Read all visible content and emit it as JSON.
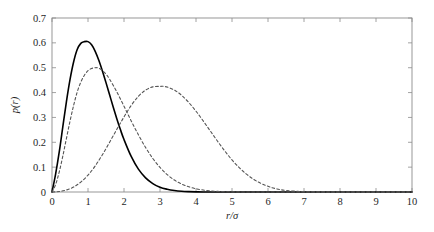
{
  "figure": {
    "background_color": "#ffffff",
    "frame_color": "#8c8c8c"
  },
  "axes": {
    "x_title": "r/σ",
    "y_title": "p(r)",
    "x_ticks": [
      "0",
      "1",
      "2",
      "3",
      "4",
      "5",
      "6",
      "7",
      "8",
      "9",
      "10"
    ],
    "y_ticks": [
      "0",
      "0.1",
      "0.2",
      "0.3",
      "0.4",
      "0.5",
      "0.6",
      "0.7"
    ]
  },
  "chart_data": {
    "type": "line",
    "title": "",
    "xlabel": "r/σ",
    "ylabel": "p(r)",
    "xlim": [
      0,
      10
    ],
    "ylim": [
      0,
      0.7
    ],
    "xticks": [
      0,
      1,
      2,
      3,
      4,
      5,
      6,
      7,
      8,
      9,
      10
    ],
    "yticks": [
      0,
      0.1,
      0.2,
      0.3,
      0.4,
      0.5,
      0.6,
      0.7
    ],
    "grid": false,
    "legend": "none",
    "tick_direction": "in",
    "tick_sides": [
      "bottom",
      "left",
      "top",
      "right"
    ],
    "series": [
      {
        "name": "curve-solid",
        "style": "solid",
        "color": "#000000",
        "linewidth": 1.6,
        "peak_x": 1.0,
        "peak_y": 0.605,
        "x": [
          0.0,
          0.1,
          0.2,
          0.3,
          0.4,
          0.5,
          0.6,
          0.7,
          0.8,
          0.9,
          1.0,
          1.1,
          1.2,
          1.3,
          1.4,
          1.5,
          1.6,
          1.7,
          1.8,
          1.9,
          2.0,
          2.2,
          2.4,
          2.6,
          2.8,
          3.0,
          3.2,
          3.4,
          3.6,
          3.8,
          4.0,
          4.2,
          4.5,
          5.0,
          5.5,
          6.0,
          7.0,
          8.0,
          9.0,
          10.0
        ],
        "y": [
          0.0,
          0.072,
          0.16,
          0.262,
          0.363,
          0.452,
          0.523,
          0.573,
          0.598,
          0.605,
          0.605,
          0.592,
          0.566,
          0.53,
          0.487,
          0.44,
          0.391,
          0.342,
          0.295,
          0.251,
          0.211,
          0.143,
          0.092,
          0.057,
          0.034,
          0.019,
          0.011,
          0.006,
          0.003,
          0.0015,
          0.0007,
          0.0003,
          0.0001,
          0.0,
          0.0,
          0.0,
          0.0,
          0.0,
          0.0,
          0.0
        ]
      },
      {
        "name": "curve-dashed-1",
        "style": "dashed",
        "color": "#555555",
        "linewidth": 1.1,
        "peak_x": 1.25,
        "peak_y": 0.5,
        "x": [
          0.0,
          0.1,
          0.2,
          0.3,
          0.4,
          0.5,
          0.6,
          0.7,
          0.8,
          0.9,
          1.0,
          1.1,
          1.2,
          1.25,
          1.3,
          1.4,
          1.5,
          1.6,
          1.8,
          2.0,
          2.2,
          2.4,
          2.6,
          2.8,
          3.0,
          3.2,
          3.4,
          3.6,
          3.8,
          4.0,
          4.2,
          4.4,
          4.6,
          4.8,
          5.0,
          5.5,
          6.0,
          7.0,
          8.0,
          9.0,
          10.0
        ],
        "y": [
          0.0,
          0.03,
          0.08,
          0.144,
          0.215,
          0.285,
          0.348,
          0.402,
          0.442,
          0.47,
          0.488,
          0.497,
          0.5,
          0.5,
          0.498,
          0.489,
          0.474,
          0.454,
          0.403,
          0.345,
          0.286,
          0.23,
          0.179,
          0.135,
          0.099,
          0.07,
          0.048,
          0.032,
          0.021,
          0.013,
          0.008,
          0.0045,
          0.0024,
          0.0012,
          0.0006,
          0.0001,
          0.0,
          0.0,
          0.0,
          0.0,
          0.0
        ]
      },
      {
        "name": "curve-dashed-2",
        "style": "dashed",
        "color": "#555555",
        "linewidth": 1.1,
        "peak_x": 3.1,
        "peak_y": 0.425,
        "x": [
          0.0,
          0.2,
          0.4,
          0.6,
          0.8,
          1.0,
          1.2,
          1.4,
          1.6,
          1.8,
          2.0,
          2.2,
          2.4,
          2.6,
          2.8,
          3.0,
          3.1,
          3.2,
          3.4,
          3.6,
          3.8,
          4.0,
          4.2,
          4.4,
          4.6,
          4.8,
          5.0,
          5.2,
          5.4,
          5.6,
          5.8,
          6.0,
          6.2,
          6.5,
          7.0,
          7.5,
          8.0,
          9.0,
          10.0
        ],
        "y": [
          0.0,
          0.002,
          0.008,
          0.02,
          0.04,
          0.068,
          0.105,
          0.15,
          0.2,
          0.252,
          0.302,
          0.348,
          0.385,
          0.41,
          0.423,
          0.425,
          0.425,
          0.422,
          0.41,
          0.389,
          0.36,
          0.325,
          0.286,
          0.245,
          0.204,
          0.165,
          0.129,
          0.098,
          0.072,
          0.051,
          0.035,
          0.023,
          0.014,
          0.006,
          0.0015,
          0.0004,
          0.0001,
          0.0,
          0.0
        ]
      }
    ]
  }
}
